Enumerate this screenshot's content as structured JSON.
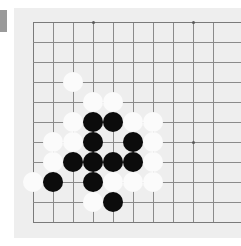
{
  "app": {
    "title": "Go board position",
    "board_type": "go-goban"
  },
  "marker": {
    "name": "left-edge-marker",
    "color": "#9a9a9a"
  },
  "board": {
    "background_color": "#eeeeee",
    "panel_color": "#efefef",
    "line_color": "#8a8a8a",
    "black_stone_color": "#0c0c0c",
    "white_stone_color": "#fbfbfb",
    "cell_size": 20,
    "origin_x": 19,
    "origin_y": 14,
    "vertical_lines_x": [
      19,
      39,
      59,
      79,
      99,
      119,
      139,
      159,
      179,
      199
    ],
    "horizontal_lines_y": [
      14,
      34,
      54,
      74,
      94,
      114,
      134,
      154,
      174,
      194,
      214
    ],
    "star_points": [
      {
        "x": 79,
        "y": 14
      },
      {
        "x": 179,
        "y": 14
      },
      {
        "x": 179,
        "y": 134
      }
    ],
    "stone_diameter": 20,
    "stones": [
      {
        "color": "white",
        "x": 59,
        "y": 74
      },
      {
        "color": "white",
        "x": 79,
        "y": 94
      },
      {
        "color": "white",
        "x": 99,
        "y": 94
      },
      {
        "color": "white",
        "x": 59,
        "y": 114
      },
      {
        "color": "black",
        "x": 79,
        "y": 114
      },
      {
        "color": "black",
        "x": 99,
        "y": 114
      },
      {
        "color": "white",
        "x": 119,
        "y": 114
      },
      {
        "color": "white",
        "x": 139,
        "y": 114
      },
      {
        "color": "white",
        "x": 39,
        "y": 134
      },
      {
        "color": "white",
        "x": 59,
        "y": 134
      },
      {
        "color": "black",
        "x": 79,
        "y": 134
      },
      {
        "color": "black",
        "x": 119,
        "y": 134
      },
      {
        "color": "white",
        "x": 139,
        "y": 134
      },
      {
        "color": "white",
        "x": 39,
        "y": 154
      },
      {
        "color": "black",
        "x": 59,
        "y": 154
      },
      {
        "color": "black",
        "x": 79,
        "y": 154
      },
      {
        "color": "black",
        "x": 99,
        "y": 154
      },
      {
        "color": "black",
        "x": 119,
        "y": 154
      },
      {
        "color": "white",
        "x": 139,
        "y": 154
      },
      {
        "color": "white",
        "x": 19,
        "y": 174
      },
      {
        "color": "black",
        "x": 39,
        "y": 174
      },
      {
        "color": "black",
        "x": 79,
        "y": 174
      },
      {
        "color": "white",
        "x": 99,
        "y": 174
      },
      {
        "color": "white",
        "x": 119,
        "y": 174
      },
      {
        "color": "white",
        "x": 139,
        "y": 174
      },
      {
        "color": "white",
        "x": 79,
        "y": 194
      },
      {
        "color": "black",
        "x": 99,
        "y": 194
      }
    ]
  }
}
